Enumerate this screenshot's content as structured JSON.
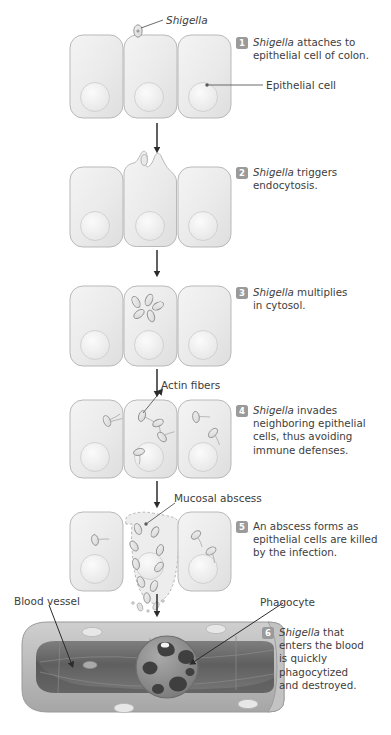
{
  "figure": {
    "colors": {
      "cell_fill": "#ededed",
      "cell_stroke": "#b9b9b9",
      "nucleus_fill": "#f6f6f6",
      "bacterium_fill": "#e3e3e3",
      "bacterium_stroke": "#8f8f8f",
      "badge_bg": "#9a9a9a",
      "badge_text": "#ffffff",
      "text": "#3d3d3d",
      "leader_line": "#5a5a5a",
      "arrow": "#2b2b2b",
      "vessel_wall": "#b4b4b4",
      "vessel_lumen": "#6e6e6e",
      "vessel_lumen_dark": "#545454",
      "phagocyte_fill": "#8d8d8d",
      "phagocyte_inclusion": "#3f3f3f"
    }
  },
  "callouts": [
    {
      "id": "shigella",
      "label": "Shigella",
      "italic": true,
      "x": 166,
      "y": 16
    },
    {
      "id": "epithelial-cell",
      "label": "Epithelial cell",
      "italic": false,
      "x": 266,
      "y": 81
    },
    {
      "id": "actin-fibers",
      "label": "Actin fibers",
      "italic": false,
      "x": 161,
      "y": 380
    },
    {
      "id": "mucosal-abscess",
      "label": "Mucosal abscess",
      "italic": false,
      "x": 174,
      "y": 494
    },
    {
      "id": "blood-vessel",
      "label": "Blood vessel",
      "italic": false,
      "x": 14,
      "y": 596
    },
    {
      "id": "phagocyte",
      "label": "Phagocyte",
      "italic": false,
      "x": 260,
      "y": 597
    }
  ],
  "steps": [
    {
      "number": "1",
      "lines": [
        "Shigella attaches to",
        "epithelial cell of colon."
      ],
      "italic_lead": "Shigella",
      "rest_first_line": " attaches to",
      "x": 236,
      "y": 36
    },
    {
      "number": "2",
      "lines": [
        "Shigella triggers",
        "endocytosis."
      ],
      "italic_lead": "Shigella",
      "rest_first_line": " triggers",
      "x": 236,
      "y": 166
    },
    {
      "number": "3",
      "lines": [
        "Shigella multiplies",
        "in cytosol."
      ],
      "italic_lead": "Shigella",
      "rest_first_line": " multiplies",
      "x": 236,
      "y": 286
    },
    {
      "number": "4",
      "lines": [
        "Shigella invades",
        "neighboring epithelial",
        "cells, thus avoiding",
        "immune defenses."
      ],
      "italic_lead": "Shigella",
      "rest_first_line": " invades",
      "x": 236,
      "y": 404
    },
    {
      "number": "5",
      "lines": [
        "An abscess forms as",
        "epithelial cells are killed",
        "by the infection."
      ],
      "italic_lead": "",
      "rest_first_line": "An abscess forms as",
      "x": 236,
      "y": 520
    },
    {
      "number": "6",
      "lines": [
        "Shigella that",
        "enters the blood",
        "is quickly",
        "phagocytized",
        "and destroyed."
      ],
      "italic_lead": "Shigella",
      "rest_first_line": " that",
      "x": 262,
      "y": 626
    }
  ],
  "panels": [
    {
      "id": "panel-1",
      "step": "1",
      "description": "Three epithelial cells side by side; one bacterium attached on top of the middle cell."
    },
    {
      "id": "panel-2",
      "step": "2",
      "description": "Middle cell membrane forms a pocket engulfing the bacterium (endocytosis)."
    },
    {
      "id": "panel-3",
      "step": "3",
      "description": "Five bacteria multiply inside the cytosol of the middle cell."
    },
    {
      "id": "panel-4",
      "step": "4",
      "description": "Bacteria with actin-fiber tails spread into all three cells."
    },
    {
      "id": "panel-5",
      "step": "5",
      "description": "Middle cell becomes a ragged mucosal abscess; bacteria escape downward."
    },
    {
      "id": "panel-6",
      "step": "6",
      "description": "Cutaway blood vessel containing a phagocyte that has engulfed Shigella."
    }
  ],
  "arrows": [
    {
      "id": "arrow-1-2",
      "x": 157,
      "y1": 123,
      "y2": 152
    },
    {
      "id": "arrow-2-3",
      "x": 157,
      "y1": 248,
      "y2": 275
    },
    {
      "id": "arrow-3-4",
      "x": 157,
      "y1": 366,
      "y2": 396
    },
    {
      "id": "arrow-4-5",
      "x": 157,
      "y1": 478,
      "y2": 506
    },
    {
      "id": "arrow-5-6",
      "x": 157,
      "y1": 592,
      "y2": 614
    }
  ]
}
